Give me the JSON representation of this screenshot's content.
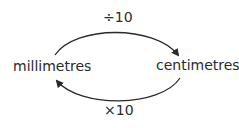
{
  "diagram": {
    "left_node": "millimetres",
    "right_node": "centimetres",
    "top_arrow": {
      "label": "÷10",
      "direction": "left-to-right"
    },
    "bottom_arrow": {
      "label": "×10",
      "direction": "right-to-left"
    },
    "stroke_color": "#2a2a2a"
  }
}
